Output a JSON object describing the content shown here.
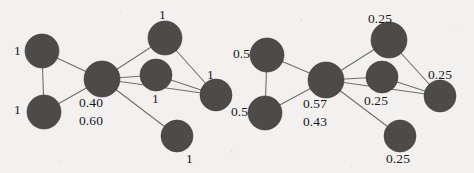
{
  "figure": {
    "background_color": "#f2f1ef",
    "node_color": "#4c4b4a",
    "edge_color": "#6f6f6d",
    "label_color": "#18171a"
  },
  "chart_data": {
    "type": "diagram",
    "title": "",
    "graphs": [
      {
        "name": "left-graph",
        "node_count": 7,
        "edge_count": 9,
        "nodes": [
          {
            "id": "L1",
            "label": "1",
            "cx": 42,
            "cy": 51,
            "r": 17,
            "label_x": 14,
            "label_y": 44
          },
          {
            "id": "L2",
            "label": "1",
            "cx": 44,
            "cy": 112,
            "r": 17,
            "label_x": 14,
            "label_y": 103
          },
          {
            "id": "L3",
            "label": "0.40",
            "cx": 102,
            "cy": 79,
            "r": 18,
            "label_x": 79,
            "label_y": 96
          },
          {
            "id": "L4",
            "label": "1",
            "cx": 165,
            "cy": 38,
            "r": 17,
            "label_x": 159,
            "label_y": 8
          },
          {
            "id": "L5",
            "label": "1",
            "cx": 156,
            "cy": 75,
            "r": 16,
            "label_x": 152,
            "label_y": 92
          },
          {
            "id": "L6",
            "label": "1",
            "cx": 216,
            "cy": 95,
            "r": 16,
            "label_x": 207,
            "label_y": 68
          },
          {
            "id": "L7",
            "label": "1",
            "cx": 177,
            "cy": 136,
            "r": 16,
            "label_x": 186,
            "label_y": 152
          }
        ],
        "extra_labels": [
          {
            "text": "0.60",
            "x": 79,
            "y": 114
          }
        ],
        "edges": [
          [
            "L1",
            "L2"
          ],
          [
            "L1",
            "L3"
          ],
          [
            "L2",
            "L3"
          ],
          [
            "L3",
            "L4"
          ],
          [
            "L3",
            "L5"
          ],
          [
            "L3",
            "L6"
          ],
          [
            "L3",
            "L7"
          ],
          [
            "L4",
            "L6"
          ],
          [
            "L5",
            "L6"
          ]
        ]
      },
      {
        "name": "right-graph",
        "node_count": 7,
        "edge_count": 9,
        "nodes": [
          {
            "id": "R1",
            "label": "0.5",
            "cx": 267,
            "cy": 55,
            "r": 17,
            "label_x": 233,
            "label_y": 47
          },
          {
            "id": "R2",
            "label": "0.5",
            "cx": 265,
            "cy": 113,
            "r": 17,
            "label_x": 231,
            "label_y": 105
          },
          {
            "id": "R3",
            "label": "0.57",
            "cx": 326,
            "cy": 80,
            "r": 18,
            "label_x": 303,
            "label_y": 97
          },
          {
            "id": "R4",
            "label": "0.25",
            "cx": 389,
            "cy": 40,
            "r": 18,
            "label_x": 368,
            "label_y": 12
          },
          {
            "id": "R5",
            "label": "0.25",
            "cx": 382,
            "cy": 77,
            "r": 16,
            "label_x": 364,
            "label_y": 94
          },
          {
            "id": "R6",
            "label": "0.25",
            "cx": 440,
            "cy": 96,
            "r": 16,
            "label_x": 428,
            "label_y": 68
          },
          {
            "id": "R7",
            "label": "0.25",
            "cx": 400,
            "cy": 136,
            "r": 16,
            "label_x": 386,
            "label_y": 152
          }
        ],
        "extra_labels": [
          {
            "text": "0.43",
            "x": 303,
            "y": 115
          }
        ],
        "edges": [
          [
            "R1",
            "R2"
          ],
          [
            "R1",
            "R3"
          ],
          [
            "R2",
            "R3"
          ],
          [
            "R3",
            "R4"
          ],
          [
            "R3",
            "R5"
          ],
          [
            "R3",
            "R6"
          ],
          [
            "R3",
            "R7"
          ],
          [
            "R4",
            "R6"
          ],
          [
            "R5",
            "R6"
          ]
        ]
      }
    ]
  }
}
